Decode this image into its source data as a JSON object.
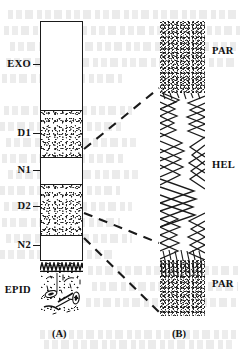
{
  "figure": {
    "kind": "cuticle-cross-section-diagram",
    "panels": [
      {
        "caption": "(A)",
        "id": "panel-a",
        "description": "stratified cuticle column",
        "layers": [
          {
            "label": "EXO",
            "fill": "blank",
            "top": 0,
            "height": 89
          },
          {
            "label": "D1",
            "fill": "stipple",
            "top": 89,
            "height": 47
          },
          {
            "label": "N1",
            "fill": "blank",
            "top": 136,
            "height": 27
          },
          {
            "label": "D2",
            "fill": "stipple",
            "top": 163,
            "height": 51
          },
          {
            "label": "N2",
            "fill": "blank",
            "top": 214,
            "height": 24
          },
          {
            "label": "EPID",
            "fill": "cellular",
            "top": 241,
            "height": 54
          }
        ]
      },
      {
        "caption": "(B)",
        "id": "panel-b",
        "description": "magnified lamellate fine structure",
        "layers": [
          {
            "label": "PAR",
            "fill": "stipple-dense",
            "top": 0,
            "height": 72
          },
          {
            "label": "HEL",
            "fill": "chevron-lamellae",
            "top": 72,
            "height": 167
          },
          {
            "label": "PAR",
            "fill": "stipple-dense",
            "top": 239,
            "height": 56
          }
        ]
      }
    ],
    "leaders": [
      {
        "name": "leader-upper",
        "from_panel": "panel-a",
        "to_panel": "panel-b"
      },
      {
        "name": "leader-middle",
        "from_panel": "panel-a",
        "to_panel": "panel-b"
      },
      {
        "name": "leader-lower",
        "from_panel": "panel-a",
        "to_panel": "panel-b"
      }
    ],
    "colors": {
      "ink": "#1a1a1a",
      "background": "#ffffff",
      "bleed_through": "#8d8d8d"
    }
  }
}
